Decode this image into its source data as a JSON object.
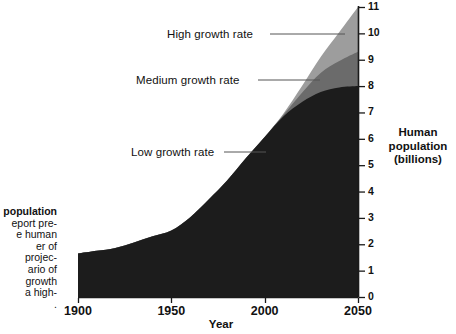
{
  "figure": {
    "kind": "area-chart-figure",
    "caption_lines": [
      {
        "text": "population",
        "bold": true
      },
      {
        "text": "eport pre-",
        "bold": false
      },
      {
        "text": "e human",
        "bold": false
      },
      {
        "text": "er of",
        "bold": false
      },
      {
        "text": "projec-",
        "bold": false
      },
      {
        "text": "ario of",
        "bold": false
      },
      {
        "text": "growth",
        "bold": false
      },
      {
        "text": "a high-",
        "bold": false
      },
      {
        "text": ".",
        "bold": false
      }
    ]
  },
  "chart_data": {
    "type": "area",
    "title": "",
    "subtitle": "",
    "xlabel": "Year",
    "ylabel": "Human population (billions)",
    "ylabel_lines": [
      "Human",
      "population",
      "(billions)"
    ],
    "xlim": [
      1900,
      2050
    ],
    "ylim": [
      0,
      11
    ],
    "grid": false,
    "legend_position": "inline-annotations",
    "xticks": [
      1900,
      1950,
      2000,
      2050
    ],
    "xtick_labels": [
      "1900",
      "1950",
      "2000",
      "2050"
    ],
    "yticks": [
      0,
      1,
      2,
      3,
      4,
      5,
      6,
      7,
      8,
      9,
      10,
      11
    ],
    "ytick_labels": [
      "0",
      "1",
      "2",
      "3",
      "4",
      "5",
      "6",
      "7",
      "8",
      "9",
      "10",
      "11"
    ],
    "stacking": "overlaid-bands",
    "x": [
      1900,
      1910,
      1920,
      1930,
      1940,
      1950,
      1960,
      1970,
      1980,
      1990,
      2000,
      2010,
      2020,
      2030,
      2040,
      2050
    ],
    "series": [
      {
        "name": "High growth rate",
        "label": "High growth rate",
        "color": "#9d9d9d",
        "values": [
          1.65,
          1.75,
          1.86,
          2.07,
          2.3,
          2.52,
          3.02,
          3.7,
          4.43,
          5.27,
          6.07,
          6.95,
          8.0,
          9.1,
          10.05,
          11.0
        ]
      },
      {
        "name": "Medium growth rate",
        "label": "Medium growth rate",
        "color": "#6b6b6b",
        "values": [
          1.65,
          1.75,
          1.86,
          2.07,
          2.3,
          2.52,
          3.02,
          3.7,
          4.43,
          5.27,
          6.07,
          6.9,
          7.75,
          8.5,
          8.95,
          9.3
        ]
      },
      {
        "name": "Low growth rate",
        "label": "Low growth rate",
        "color": "#1c1c1c",
        "values": [
          1.65,
          1.75,
          1.86,
          2.07,
          2.3,
          2.52,
          3.02,
          3.7,
          4.43,
          5.27,
          6.07,
          6.85,
          7.4,
          7.78,
          7.95,
          8.0
        ]
      }
    ],
    "annotations": [
      {
        "name": "high-growth-rate",
        "text": "High growth rate"
      },
      {
        "name": "medium-growth-rate",
        "text": "Medium growth rate"
      },
      {
        "name": "low-growth-rate",
        "text": "Low growth rate"
      }
    ],
    "colors": {
      "high": "#9d9d9d",
      "medium": "#6b6b6b",
      "low": "#1c1c1c",
      "axis": "#1a1a1a",
      "leader_line": "#555555",
      "background": "#ffffff"
    }
  }
}
